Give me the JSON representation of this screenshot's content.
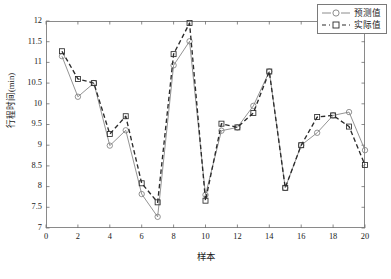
{
  "chart_data": {
    "type": "line",
    "title": "",
    "subtitle": "",
    "xlabel": "样本",
    "ylabel": "行程时间(min)",
    "xlim": [
      0,
      20
    ],
    "ylim": [
      7,
      12
    ],
    "xticks": [
      0,
      2,
      4,
      6,
      8,
      10,
      12,
      14,
      16,
      18,
      20
    ],
    "xtick_labels": [
      "0",
      "2",
      "4",
      "6",
      "8",
      "10",
      "12",
      "14",
      "16",
      "18",
      "20"
    ],
    "yticks": [
      7,
      7.5,
      8,
      8.5,
      9,
      9.5,
      10,
      10.5,
      11,
      11.5,
      12
    ],
    "ytick_labels": [
      "7",
      "7.5",
      "8",
      "8.5",
      "9",
      "9.5",
      "10",
      "10.5",
      "11",
      "11.5",
      "12"
    ],
    "grid": false,
    "legend_position": "top-right-inside",
    "x": [
      1,
      2,
      3,
      4,
      5,
      6,
      7,
      8,
      9,
      10,
      11,
      12,
      13,
      14,
      15,
      16,
      17,
      18,
      19,
      20
    ],
    "series": [
      {
        "name": "预测值",
        "marker": "circle",
        "linestyle": "solid",
        "color": "#808080",
        "values": [
          11.15,
          10.17,
          10.5,
          8.99,
          9.36,
          7.82,
          7.27,
          10.93,
          11.51,
          7.8,
          9.35,
          9.43,
          9.95,
          10.78,
          7.97,
          9.0,
          9.3,
          9.72,
          9.8,
          8.88
        ]
      },
      {
        "name": "实际值",
        "marker": "square",
        "linestyle": "dashed",
        "color": "#2b2b2b",
        "values": [
          11.27,
          10.6,
          10.5,
          9.27,
          9.7,
          8.08,
          7.62,
          11.2,
          11.95,
          7.66,
          9.52,
          9.43,
          9.78,
          10.78,
          7.97,
          9.0,
          9.68,
          9.72,
          9.45,
          8.52
        ]
      }
    ]
  },
  "legend": {
    "entries": [
      {
        "label": "预测值"
      },
      {
        "label": "实际值"
      }
    ]
  }
}
